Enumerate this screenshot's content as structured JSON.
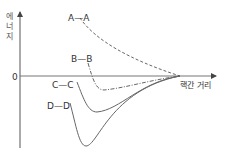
{
  "diagram": {
    "y_axis_label_chars": [
      "에",
      "너",
      "지"
    ],
    "zero_label": "0",
    "x_axis_label": "핵간 거리",
    "curves": [
      {
        "label": "A—A",
        "style": "dashed",
        "description": "repulsive, no minimum"
      },
      {
        "label": "B—B",
        "style": "dash-dot",
        "description": "shallow minimum"
      },
      {
        "label": "C—C",
        "style": "solid",
        "description": "medium minimum"
      },
      {
        "label": "D—D",
        "style": "solid",
        "description": "deep minimum"
      }
    ]
  }
}
